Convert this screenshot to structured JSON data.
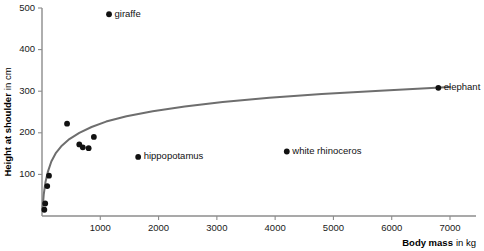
{
  "chart_data": {
    "type": "scatter",
    "title": "",
    "xlabel": "Body mass",
    "xlabel_unit": "in kg",
    "ylabel": "Height at shoulder",
    "ylabel_unit": "in cm",
    "xlim": [
      0,
      7000
    ],
    "ylim": [
      0,
      500
    ],
    "xticks": [
      0,
      1000,
      2000,
      3000,
      4000,
      5000,
      6000,
      7000
    ],
    "xticklabels": [
      "",
      "1000",
      "2000",
      "3000",
      "4000",
      "5000",
      "6000",
      "7000"
    ],
    "yticks": [
      0,
      100,
      200,
      300,
      400,
      500
    ],
    "yticklabels": [
      "",
      "100",
      "200",
      "300",
      "400",
      "500"
    ],
    "grid": false,
    "legend": "none",
    "points": [
      {
        "label": "",
        "x": 40,
        "y": 15
      },
      {
        "label": "",
        "x": 55,
        "y": 30
      },
      {
        "label": "",
        "x": 90,
        "y": 72
      },
      {
        "label": "",
        "x": 120,
        "y": 97
      },
      {
        "label": "",
        "x": 430,
        "y": 222
      },
      {
        "label": "",
        "x": 640,
        "y": 172
      },
      {
        "label": "",
        "x": 700,
        "y": 165
      },
      {
        "label": "",
        "x": 800,
        "y": 163
      },
      {
        "label": "",
        "x": 890,
        "y": 190
      },
      {
        "label": "giraffe",
        "x": 1150,
        "y": 485
      },
      {
        "label": "hippopotamus",
        "x": 1650,
        "y": 142
      },
      {
        "label": "white rhinoceros",
        "x": 4200,
        "y": 155
      },
      {
        "label": "elephant",
        "x": 6800,
        "y": 308
      }
    ],
    "fit_curve": {
      "description": "saturating logarithmic fit of shoulder height vs body mass",
      "x": [
        10,
        30,
        60,
        100,
        160,
        240,
        340,
        470,
        640,
        850,
        1100,
        1450,
        1900,
        2450,
        3100,
        3900,
        4800,
        5800,
        7000
      ],
      "y": [
        18,
        52,
        82,
        106,
        131,
        152,
        169,
        185,
        200,
        214,
        227,
        240,
        252,
        263,
        274,
        284,
        293,
        301,
        310
      ]
    }
  }
}
